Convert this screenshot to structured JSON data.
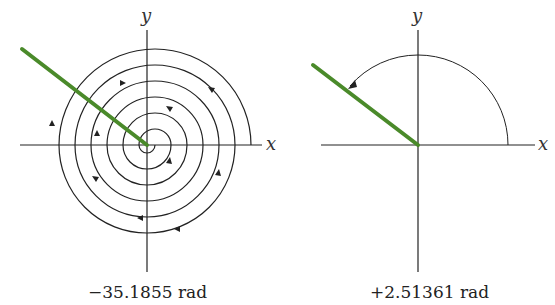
{
  "panels": [
    {
      "id": "left",
      "caption": "−35.1855 rad",
      "x_axis_label": "x",
      "y_axis_label": "y",
      "angle_rad": -35.1855,
      "description": "clockwise spiral winding multiple turns"
    },
    {
      "id": "right",
      "caption": "+2.51361 rad",
      "x_axis_label": "x",
      "y_axis_label": "y",
      "angle_rad": 2.51361,
      "description": "counter-clockwise arc from x-axis to ray"
    }
  ],
  "colors": {
    "ray": "#4a8a2a",
    "axes": "#222222",
    "curve": "#222222"
  }
}
